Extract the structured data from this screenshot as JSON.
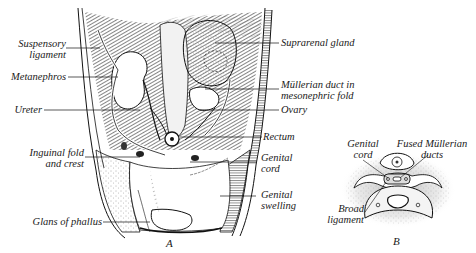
{
  "figure": {
    "panel_a": {
      "letter": "A",
      "labels_left": [
        {
          "line1": "Suspensory",
          "line2": "ligament"
        },
        {
          "line1": "Metanephros"
        },
        {
          "line1": "Ureter"
        },
        {
          "line1": "Inguinal fold",
          "line2": "and crest"
        },
        {
          "line1": "Glans of phallus"
        }
      ],
      "labels_right": [
        {
          "line1": "Suprarenal gland"
        },
        {
          "line1": "Müllerian duct in",
          "line2": "mesonephric fold"
        },
        {
          "line1": "Ovary"
        },
        {
          "line1": "Rectum"
        },
        {
          "line1": "Genital",
          "line2": "cord"
        },
        {
          "line1": "Genital",
          "line2": "swelling"
        }
      ]
    },
    "panel_b": {
      "letter": "B",
      "labels": [
        {
          "line1": "Genital",
          "line2": "cord"
        },
        {
          "line1": "Fused Müllerian",
          "line2": "ducts"
        },
        {
          "line1": "Broad",
          "line2": "ligament"
        }
      ]
    }
  }
}
